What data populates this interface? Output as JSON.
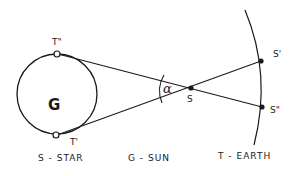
{
  "diagram": {
    "type": "geometry-sketch",
    "labels": {
      "star_center": "G",
      "star_top": "T\"",
      "star_bottom": "T'",
      "sun_point": "S",
      "angle": "α",
      "earth_top": "S'",
      "earth_bottom": "S\""
    },
    "captions": {
      "star": "S - STAR",
      "sun": "G - SUN",
      "earth": "T - EARTH"
    },
    "colors": {
      "ink": "#1a1a1a",
      "background": "#ffffff"
    }
  }
}
